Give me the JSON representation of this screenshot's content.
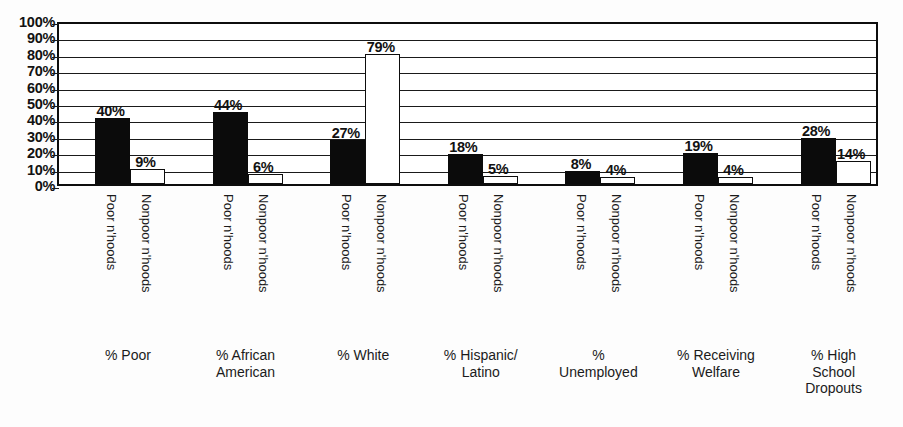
{
  "chart": {
    "type": "bar",
    "title": "",
    "subtitle": "",
    "xlabel": "",
    "ylabel": "",
    "ylim": [
      0,
      100
    ],
    "grid": true,
    "legend_position": "none",
    "axis_color": "#0d0d0d",
    "series_colors": {
      "poor": "#0b0b0b",
      "nonpoor": "#ffffff"
    },
    "yticks": [
      "100%",
      "90%",
      "80%",
      "70%",
      "60%",
      "50%",
      "40%",
      "30%",
      "20%",
      "10%",
      "0%"
    ],
    "ytick_values": [
      100,
      90,
      80,
      70,
      60,
      50,
      40,
      30,
      20,
      10,
      0
    ],
    "series_labels": [
      "Poor n'hoods",
      "Nonpoor n'hoods"
    ]
  },
  "chart_data": {
    "type": "bar",
    "title": "",
    "xlabel": "",
    "ylabel": "",
    "ylim": [
      0,
      100
    ],
    "grid": true,
    "legend_position": "none",
    "categories": [
      "% Poor",
      "% African American",
      "% White",
      "% Hispanic/ Latino",
      "% Unemployed",
      "% Receiving Welfare",
      "% High School Dropouts"
    ],
    "category_lines": [
      [
        "% Poor"
      ],
      [
        "% African",
        "American"
      ],
      [
        "% White"
      ],
      [
        "% Hispanic/",
        "Latino"
      ],
      [
        "%",
        "Unemployed"
      ],
      [
        "% Receiving",
        "Welfare"
      ],
      [
        "% High",
        "School",
        "Dropouts"
      ]
    ],
    "series": [
      {
        "name": "Poor n'hoods",
        "values": [
          40,
          44,
          27,
          18,
          8,
          19,
          28
        ],
        "labels": [
          "40%",
          "44%",
          "27%",
          "18%",
          "8%",
          "19%",
          "28%"
        ]
      },
      {
        "name": "Nonpoor n'hoods",
        "values": [
          9,
          6,
          79,
          5,
          4,
          4,
          14
        ],
        "labels": [
          "9%",
          "6%",
          "79%",
          "5%",
          "4%",
          "4%",
          "14%"
        ]
      }
    ]
  }
}
